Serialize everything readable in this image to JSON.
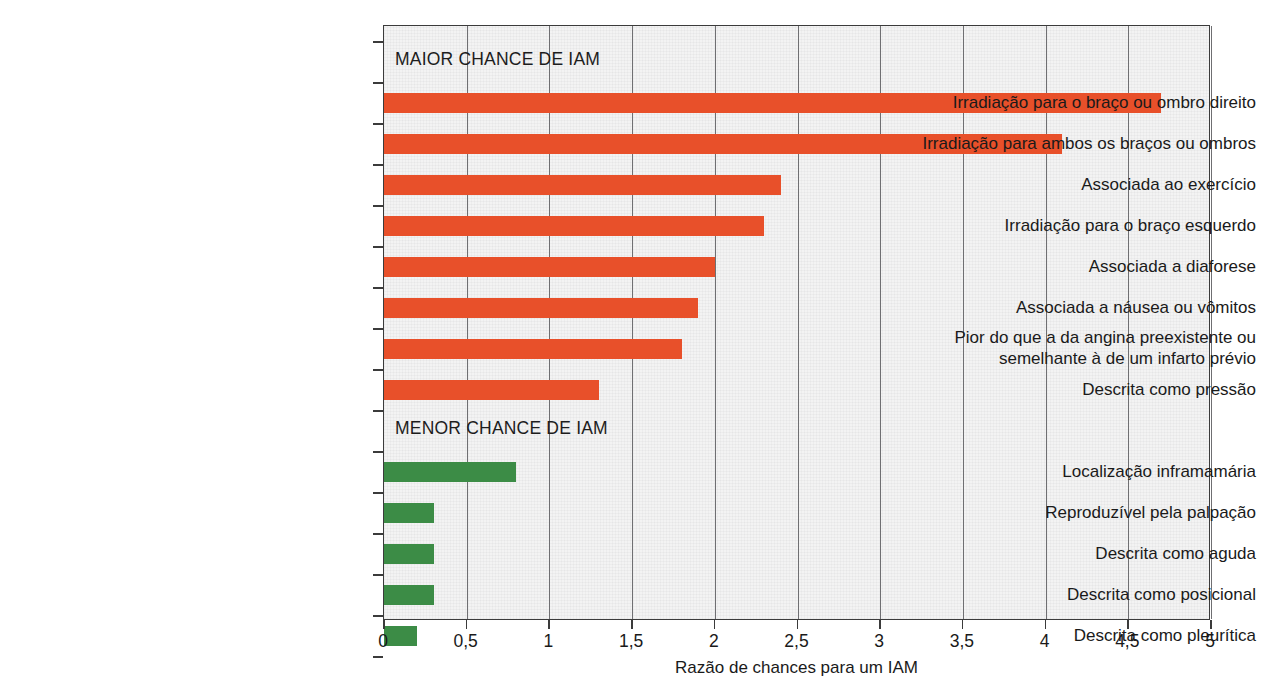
{
  "chart_data": {
    "type": "bar",
    "orientation": "horizontal",
    "title": "",
    "xlabel": "Razão de chances para um IAM",
    "ylabel": "",
    "xlim": [
      0,
      5
    ],
    "xticks": [
      0,
      0.5,
      1,
      1.5,
      2,
      2.5,
      3,
      3.5,
      4,
      4.5,
      5
    ],
    "xtick_labels": [
      "0",
      "0,5",
      "1",
      "1,5",
      "2",
      "2,5",
      "3",
      "3,5",
      "4",
      "4,5",
      "5"
    ],
    "decimal_separator": ",",
    "grid": "vertical gridlines at every x tick",
    "legend": "none",
    "sections": [
      {
        "header": "MAIOR CHANCE DE IAM",
        "color": "#e8502a",
        "categories": [
          "Irradiação para o braço ou ombro direito",
          "Irradiação para ambos os braços ou ombros",
          "Associada ao exercício",
          "Irradiação para o braço esquerdo",
          "Associada a diaforese",
          "Associada a náusea ou vômitos",
          "Pior do que a da angina preexistente ou\nsemelhante à de um infarto prévio",
          "Descrita como pressão"
        ],
        "values": [
          4.7,
          4.1,
          2.4,
          2.3,
          2.0,
          1.9,
          1.8,
          1.3
        ]
      },
      {
        "header": "MENOR CHANCE DE IAM",
        "color": "#3c8c46",
        "categories": [
          "Localização inframamária",
          "Reproduzível pela palpação",
          "Descrita como aguda",
          "Descrita como posicional",
          "Descrita como pleurítica"
        ],
        "values": [
          0.8,
          0.3,
          0.3,
          0.3,
          0.2
        ]
      }
    ]
  },
  "colors": {
    "higher_chance_bar": "#e8502a",
    "lower_chance_bar": "#3c8c46",
    "plot_background": "#f3f3f3",
    "axis": "#3b3b3b",
    "gridline": "#6f6f72",
    "text": "#1a1a1a"
  },
  "axis": {
    "x_title": "Razão de chances para um IAM",
    "tick_labels": [
      "0",
      "0,5",
      "1",
      "1,5",
      "2",
      "2,5",
      "3",
      "3,5",
      "4",
      "4,5",
      "5"
    ]
  },
  "sections": {
    "higher": {
      "header": "MAIOR CHANCE DE IAM"
    },
    "lower": {
      "header": "MENOR CHANCE DE IAM"
    }
  }
}
